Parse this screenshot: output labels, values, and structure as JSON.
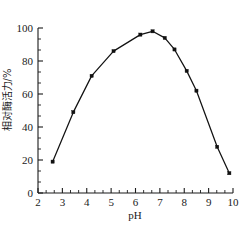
{
  "chart_data": {
    "type": "line",
    "title": "",
    "xlabel": "pH",
    "ylabel": "相对酶活力/%",
    "xlim": [
      2,
      10
    ],
    "ylim": [
      0,
      100
    ],
    "grid": false,
    "legend": null,
    "x_ticks": [
      "2",
      "3",
      "4",
      "5",
      "6",
      "7",
      "8",
      "9",
      "10"
    ],
    "x_tick_values": [
      2,
      3,
      4,
      5,
      6,
      7,
      8,
      9,
      10
    ],
    "x_minor_per_interval": 2,
    "y_ticks": [
      "0",
      "20",
      "40",
      "60",
      "80",
      "100"
    ],
    "y_tick_values": [
      0,
      20,
      40,
      60,
      80,
      100
    ],
    "y_minor_per_interval": 2,
    "marker": "square",
    "line_color": "#121212",
    "marker_color": "#111111",
    "x": [
      2.6,
      3.45,
      4.2,
      5.1,
      6.2,
      6.7,
      7.2,
      7.6,
      8.1,
      8.5,
      9.35,
      9.85
    ],
    "values": [
      19,
      49,
      71,
      86,
      96,
      98,
      94,
      87,
      74,
      62,
      28,
      12
    ],
    "points": [
      {
        "x": 2.6,
        "y": 19
      },
      {
        "x": 3.45,
        "y": 49
      },
      {
        "x": 4.2,
        "y": 71
      },
      {
        "x": 5.1,
        "y": 86
      },
      {
        "x": 6.2,
        "y": 96
      },
      {
        "x": 6.7,
        "y": 98
      },
      {
        "x": 7.2,
        "y": 94
      },
      {
        "x": 7.6,
        "y": 87
      },
      {
        "x": 8.1,
        "y": 74
      },
      {
        "x": 8.5,
        "y": 62
      },
      {
        "x": 9.35,
        "y": 28
      },
      {
        "x": 9.85,
        "y": 12
      }
    ]
  }
}
